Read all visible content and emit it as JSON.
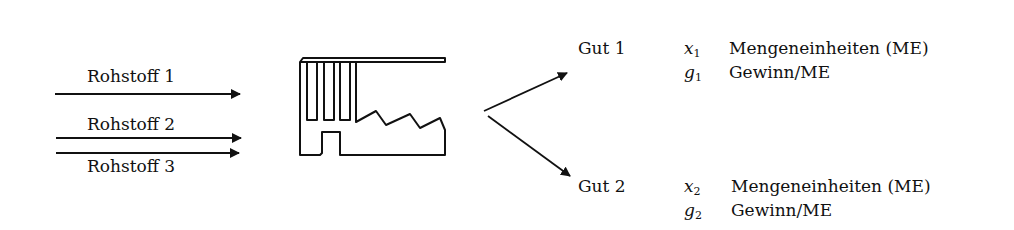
{
  "inputs": [
    {
      "label": "Rohstoff 1"
    },
    {
      "label": "Rohstoff 2"
    },
    {
      "label": "Rohstoff 3"
    }
  ],
  "factory": {
    "icon": "factory-icon"
  },
  "outputs": [
    {
      "label": "Gut 1",
      "rows": [
        {
          "var": "x",
          "sub": "1",
          "text": "Mengeneinheiten (ME)"
        },
        {
          "var": "g",
          "sub": "1",
          "text": "Gewinn/ME"
        }
      ]
    },
    {
      "label": "Gut 2",
      "rows": [
        {
          "var": "x",
          "sub": "2",
          "text": "Mengeneinheiten (ME)"
        },
        {
          "var": "g",
          "sub": "2",
          "text": "Gewinn/ME"
        }
      ]
    }
  ],
  "colors": {
    "stroke": "#111111",
    "background": "#ffffff"
  }
}
